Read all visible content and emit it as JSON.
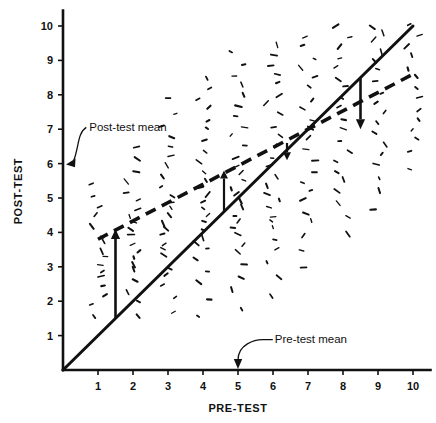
{
  "figure": {
    "title": "",
    "background_color": "#ffffff",
    "ink_color": "#111111"
  },
  "axes": {
    "x_title": "PRE-TEST",
    "y_title": "POST-TEST",
    "x_ticks": [
      "1",
      "2",
      "3",
      "4",
      "5",
      "6",
      "7",
      "8",
      "9",
      "10"
    ],
    "y_ticks": [
      "1",
      "2",
      "3",
      "4",
      "5",
      "6",
      "7",
      "8",
      "9",
      "10"
    ]
  },
  "annotations": {
    "post_test_mean_label": "Post-test mean",
    "pre_test_mean_label": "Pre-test mean"
  },
  "chart_data": {
    "type": "scatter",
    "title": "",
    "xlabel": "PRE-TEST",
    "ylabel": "POST-TEST",
    "xlim": [
      0,
      10.4
    ],
    "ylim": [
      0,
      10.4
    ],
    "xticks": [
      1,
      2,
      3,
      4,
      5,
      6,
      7,
      8,
      9,
      10
    ],
    "yticks": [
      1,
      2,
      3,
      4,
      5,
      6,
      7,
      8,
      9,
      10
    ],
    "grid": false,
    "legend": "none",
    "marker_style": "short-dash-tick",
    "annotations": [
      {
        "text": "Post-test mean",
        "points_to": "y-axis at y = 6",
        "x": 1.0,
        "y": 7.0,
        "target_x": 0.0,
        "target_y": 6.0,
        "leader": "curved"
      },
      {
        "text": "Pre-test mean",
        "points_to": "x-axis at x = 5",
        "x": 6.2,
        "y": 0.62,
        "target_x": 5.0,
        "target_y": 0.0,
        "leader": "elbow"
      }
    ],
    "reference_lines": [
      {
        "name": "identity-line",
        "style": "solid",
        "equation": "post = pre",
        "x": [
          0,
          10
        ],
        "y": [
          0,
          10
        ]
      },
      {
        "name": "regression-line",
        "style": "dashed",
        "equation": "post = 3.3 + 0.53 * pre",
        "x": [
          1.0,
          10.0
        ],
        "y": [
          3.8,
          8.6
        ]
      }
    ],
    "means": {
      "pre_test_mean": 5.0,
      "post_test_mean": 6.0
    },
    "shift_arrows": [
      {
        "name": "low-scorer-large-gain",
        "x": 1.5,
        "from_y": 1.5,
        "to_y": 4.1,
        "direction": "up",
        "size": "large"
      },
      {
        "name": "near-mean-small-gain",
        "x": 4.6,
        "from_y": 4.6,
        "to_y": 5.8,
        "direction": "up",
        "size": "small"
      },
      {
        "name": "near-mean-small-loss",
        "x": 6.4,
        "from_y": 6.6,
        "to_y": 6.1,
        "direction": "down",
        "size": "small"
      },
      {
        "name": "high-scorer-large-loss",
        "x": 8.5,
        "from_y": 8.5,
        "to_y": 7.0,
        "direction": "down",
        "size": "large"
      }
    ],
    "series": [
      {
        "name": "pre-post scores",
        "columns": [
          {
            "x": 1,
            "n": 16,
            "mean_y": 3.4,
            "spread": 1.25,
            "y_values": [
              1.5,
              1.9,
              2.2,
              2.5,
              2.7,
              2.9,
              3.1,
              3.3,
              3.5,
              3.7,
              3.9,
              4.2,
              4.5,
              4.8,
              5.1,
              5.4
            ]
          },
          {
            "x": 2,
            "n": 20,
            "mean_y": 4.0,
            "spread": 1.5,
            "y_values": [
              1.6,
              2.0,
              2.3,
              2.6,
              2.9,
              3.1,
              3.3,
              3.5,
              3.7,
              3.9,
              4.1,
              4.3,
              4.5,
              4.7,
              4.9,
              5.2,
              5.5,
              5.8,
              6.1,
              6.5
            ]
          },
          {
            "x": 3,
            "n": 24,
            "mean_y": 4.7,
            "spread": 1.8,
            "y_values": [
              1.7,
              2.1,
              2.5,
              2.8,
              3.0,
              3.3,
              3.5,
              3.7,
              3.9,
              4.1,
              4.3,
              4.5,
              4.7,
              4.9,
              5.1,
              5.3,
              5.6,
              5.9,
              6.2,
              6.5,
              6.8,
              7.1,
              7.5,
              7.9
            ]
          },
          {
            "x": 4,
            "n": 26,
            "mean_y": 5.2,
            "spread": 2.0,
            "y_values": [
              1.6,
              2.1,
              2.5,
              2.9,
              3.2,
              3.5,
              3.7,
              3.9,
              4.1,
              4.3,
              4.5,
              4.7,
              4.9,
              5.1,
              5.3,
              5.5,
              5.8,
              6.1,
              6.4,
              6.7,
              7.0,
              7.3,
              7.6,
              7.9,
              8.2,
              8.5
            ]
          },
          {
            "x": 5,
            "n": 28,
            "mean_y": 5.7,
            "spread": 2.1,
            "y_values": [
              1.8,
              2.3,
              2.7,
              3.1,
              3.4,
              3.7,
              3.9,
              4.1,
              4.3,
              4.5,
              4.7,
              4.9,
              5.1,
              5.3,
              5.5,
              5.7,
              5.9,
              6.2,
              6.5,
              6.8,
              7.1,
              7.4,
              7.7,
              8.0,
              8.3,
              8.6,
              8.9,
              9.2
            ]
          },
          {
            "x": 6,
            "n": 26,
            "mean_y": 6.2,
            "spread": 2.0,
            "y_values": [
              2.2,
              2.7,
              3.1,
              3.5,
              3.8,
              4.1,
              4.3,
              4.5,
              4.7,
              4.9,
              5.1,
              5.3,
              5.6,
              5.9,
              6.2,
              6.5,
              6.8,
              7.1,
              7.4,
              7.7,
              8.0,
              8.3,
              8.6,
              8.9,
              9.2,
              9.5
            ]
          },
          {
            "x": 7,
            "n": 22,
            "mean_y": 6.7,
            "spread": 1.9,
            "y_values": [
              3.0,
              3.5,
              3.9,
              4.3,
              4.6,
              4.9,
              5.2,
              5.5,
              5.8,
              6.1,
              6.4,
              6.7,
              7.0,
              7.3,
              7.6,
              7.9,
              8.2,
              8.5,
              8.8,
              9.1,
              9.4,
              9.7
            ]
          },
          {
            "x": 8,
            "n": 20,
            "mean_y": 7.3,
            "spread": 1.7,
            "y_values": [
              3.9,
              4.4,
              4.8,
              5.2,
              5.5,
              5.8,
              6.1,
              6.4,
              6.7,
              7.0,
              7.3,
              7.6,
              7.9,
              8.2,
              8.5,
              8.8,
              9.1,
              9.4,
              9.7,
              10.0
            ]
          },
          {
            "x": 9,
            "n": 18,
            "mean_y": 7.9,
            "spread": 1.5,
            "y_values": [
              4.7,
              5.2,
              5.6,
              6.0,
              6.3,
              6.6,
              6.9,
              7.2,
              7.5,
              7.8,
              8.1,
              8.4,
              8.7,
              9.0,
              9.3,
              9.6,
              9.8,
              10.0
            ]
          },
          {
            "x": 10,
            "n": 14,
            "mean_y": 8.5,
            "spread": 1.2,
            "y_values": [
              5.8,
              6.3,
              6.7,
              7.0,
              7.3,
              7.6,
              7.9,
              8.2,
              8.5,
              8.8,
              9.1,
              9.4,
              9.7,
              10.0
            ]
          }
        ]
      }
    ]
  }
}
